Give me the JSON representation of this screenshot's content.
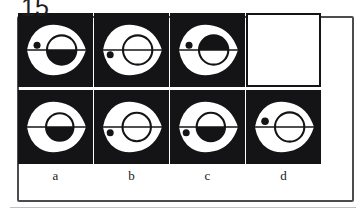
{
  "puzzle": {
    "number": "15",
    "type": "visual-analogy-matrix",
    "rows": 2,
    "columns": 4,
    "frame_color": "#4c4c50",
    "ink_color": "#141416",
    "paper_color": "#ffffff"
  },
  "options": [
    {
      "key": "a",
      "label": "a"
    },
    {
      "key": "b",
      "label": "b"
    },
    {
      "key": "c",
      "label": "c"
    },
    {
      "key": "d",
      "label": "d"
    }
  ],
  "cells": [
    {
      "id": "cell-r1c1",
      "row": 1,
      "column": 1,
      "blank": false,
      "description": "black square, white eye outline, large circle with lower half filled black, small black dot left of centre above the midline",
      "circle_fill": "bottom-half",
      "dot": true,
      "dot_position": "left-upper"
    },
    {
      "id": "cell-r1c2",
      "row": 1,
      "column": 2,
      "blank": false,
      "description": "black square, white eye outline, large circle unfilled outline, small black dot far left below the midline",
      "circle_fill": "none",
      "dot": true,
      "dot_position": "left-lower"
    },
    {
      "id": "cell-r1c3",
      "row": 1,
      "column": 3,
      "blank": false,
      "description": "black square, white eye outline, large circle with upper half filled black, small black dot left of centre above the midline",
      "circle_fill": "top-half",
      "dot": true,
      "dot_position": "left-upper"
    },
    {
      "id": "cell-r1c4",
      "row": 1,
      "column": 4,
      "blank": true,
      "description": "empty white panel — the missing figure to be chosen",
      "circle_fill": "none",
      "dot": false,
      "dot_position": "none"
    },
    {
      "id": "cell-r2c1",
      "row": 2,
      "column": 1,
      "blank": false,
      "option_key": "a",
      "description": "black square, white eye outline, large circle with lower half filled black, no dot",
      "circle_fill": "bottom-half",
      "dot": false,
      "dot_position": "none"
    },
    {
      "id": "cell-r2c2",
      "row": 2,
      "column": 2,
      "blank": false,
      "option_key": "b",
      "description": "black square, white eye outline, large circle unfilled outline, small black dot far left below the midline",
      "circle_fill": "none",
      "dot": true,
      "dot_position": "left-lower"
    },
    {
      "id": "cell-r2c3",
      "row": 2,
      "column": 3,
      "blank": false,
      "option_key": "c",
      "description": "black square, white eye outline, large circle with lower half filled black, small black dot far left below the midline",
      "circle_fill": "bottom-half",
      "dot": true,
      "dot_position": "left-lower"
    },
    {
      "id": "cell-r2c4",
      "row": 2,
      "column": 4,
      "blank": false,
      "option_key": "d",
      "description": "black square, white eye outline, large circle unfilled outline, small black dot left of centre above the midline",
      "circle_fill": "none",
      "dot": true,
      "dot_position": "left-upper"
    }
  ]
}
